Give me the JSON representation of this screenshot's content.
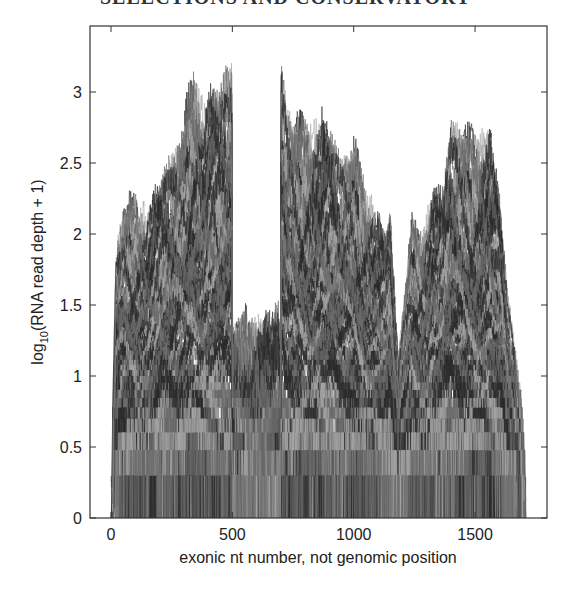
{
  "page": {
    "header_text": "SELECTIONS AND CONSERVATORY"
  },
  "chart_data": {
    "type": "line",
    "title": "",
    "xlabel": "exonic nt number, not genomic position",
    "ylabel_prefix": "log",
    "ylabel_subscript": "10",
    "ylabel_suffix": "(RNA read depth + 1)",
    "xlim": [
      -80,
      1800
    ],
    "ylim": [
      0,
      3.4
    ],
    "x_ticks": [
      0,
      500,
      1000,
      1500
    ],
    "x_tick_labels": [
      "0",
      "500",
      "1000",
      "1500"
    ],
    "y_ticks": [
      0,
      0.5,
      1,
      1.5,
      2,
      2.5,
      3
    ],
    "y_tick_labels": [
      "0",
      "0.5",
      "1",
      "1.5",
      "2",
      "2.5",
      "3"
    ],
    "grid": false,
    "legend": null,
    "series_count_approx": 120,
    "series_description": "Many overlapping gray per-sample read-depth traces (one per sample), quantized at low depth",
    "data_x_range": [
      0,
      1710
    ],
    "gap_region": {
      "x": [
        500,
        700
      ],
      "max_y": 1.6
    },
    "envelope_max": {
      "x": [
        0,
        20,
        50,
        100,
        150,
        200,
        250,
        300,
        330,
        350,
        380,
        420,
        450,
        480,
        499,
        500,
        560,
        620,
        680,
        699,
        700,
        705,
        720,
        760,
        800,
        850,
        870,
        900,
        950,
        1000,
        1050,
        1100,
        1130,
        1150,
        1170,
        1185,
        1200,
        1240,
        1280,
        1320,
        1370,
        1400,
        1450,
        1500,
        1560,
        1600,
        1630,
        1660,
        1690,
        1710
      ],
      "y": [
        0.3,
        1.9,
        2.3,
        2.35,
        2.3,
        2.5,
        2.6,
        2.9,
        3.2,
        3.27,
        3.05,
        3.2,
        3.1,
        3.25,
        3.27,
        1.45,
        1.55,
        1.5,
        1.6,
        1.6,
        3.27,
        3.25,
        3.0,
        2.9,
        2.9,
        2.95,
        3.0,
        2.85,
        2.6,
        2.75,
        2.45,
        2.25,
        2.1,
        2.25,
        1.6,
        1.15,
        1.5,
        2.2,
        2.1,
        2.4,
        2.45,
        2.85,
        2.85,
        2.8,
        2.9,
        2.4,
        1.7,
        1.3,
        0.9,
        0.3
      ]
    },
    "envelope_min": {
      "x": [
        0,
        100,
        500,
        700,
        1000,
        1180,
        1300,
        1600,
        1710
      ],
      "y": [
        0,
        0,
        0,
        0,
        0,
        0,
        0,
        0,
        0
      ]
    },
    "colors": {
      "trace_dark": "#2a2a2a",
      "trace_mid": "#6a6a6a",
      "trace_light": "#a8a8a8",
      "axis": "#333333"
    }
  }
}
